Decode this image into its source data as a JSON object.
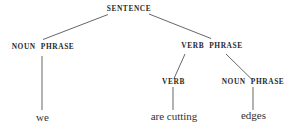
{
  "diagram": {
    "type": "syntax-tree",
    "colors": {
      "ink": "#2a2a2a",
      "line": "#555555",
      "background": "#ffffff"
    },
    "nodes": {
      "root": {
        "label": "SENTENCE"
      },
      "np_subject": {
        "label_a": "NOUN",
        "label_b": "PHRASE"
      },
      "vp": {
        "label_a": "VERB",
        "label_b": "PHRASE"
      },
      "verb": {
        "label": "VERB"
      },
      "np_object": {
        "label_a": "NOUN",
        "label_b": "PHRASE"
      }
    },
    "leaves": {
      "subject_word": "we",
      "verb_word": "are cutting",
      "object_word": "edges"
    },
    "edges": [
      {
        "from": "SENTENCE",
        "to": "NOUN PHRASE"
      },
      {
        "from": "SENTENCE",
        "to": "VERB PHRASE"
      },
      {
        "from": "NOUN PHRASE",
        "to": "we"
      },
      {
        "from": "VERB PHRASE",
        "to": "VERB"
      },
      {
        "from": "VERB PHRASE",
        "to": "NOUN PHRASE"
      },
      {
        "from": "VERB",
        "to": "are cutting"
      },
      {
        "from": "NOUN PHRASE",
        "to": "edges"
      }
    ]
  }
}
